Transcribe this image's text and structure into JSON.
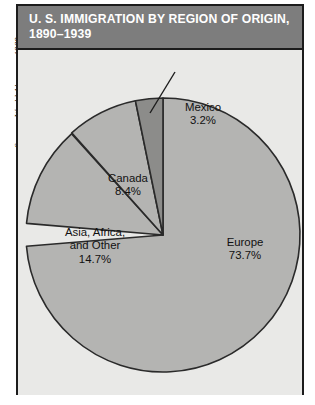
{
  "source": {
    "lead": "Source:",
    "publication": "World Almanac, 1989",
    "full": "Source: World Almanac, 1989"
  },
  "title": {
    "line1": "U. S. IMMIGRATION BY REGION OF ORIGIN,",
    "line2": "1890–1939"
  },
  "labels": {
    "mexico": {
      "name": "Mexico",
      "value": "3.2%"
    },
    "canada": {
      "name": "Canada",
      "value": "8.4%"
    },
    "asia": {
      "name_line1": "Asia, Africa,",
      "name_line2": "and Other",
      "value": "14.7%"
    },
    "europe": {
      "name": "Europe",
      "value": "73.7%"
    }
  },
  "colors": {
    "title_bar": "#7d7d7d",
    "title_text": "#ffffff",
    "panel_background": "#e9e9e7",
    "frame_border": "#1c1c1c",
    "slice_light": "#b4b4b2",
    "slice_dark": "#8c8c8a",
    "slice_outline": "#2a2a2a",
    "label_text": "#111111"
  },
  "chart_data": {
    "type": "pie",
    "subtitle": "",
    "xlabel": "",
    "ylabel": "",
    "units": "percent",
    "start_angle_deg": 0,
    "direction": "clockwise",
    "legend": "none",
    "grid": false,
    "categories": [
      "Europe",
      "Asia, Africa, and Other",
      "Canada",
      "Mexico"
    ],
    "values": [
      73.7,
      14.7,
      8.4,
      3.2
    ],
    "total": 100.0,
    "slices": [
      {
        "label": "Europe",
        "value": 73.7,
        "display": "73.7%",
        "color": "#b4b4b2",
        "start_deg": 0.0,
        "end_deg": 265.3,
        "sweep_deg": 265.3,
        "label_placement": "inside"
      },
      {
        "label": "Asia, Africa, and Other",
        "value": 14.7,
        "display": "14.7%",
        "color": "#b4b4b2",
        "start_deg": 265.3,
        "end_deg": 318.2,
        "sweep_deg": 52.9,
        "label_placement": "inside"
      },
      {
        "label": "Canada",
        "value": 8.4,
        "display": "8.4%",
        "color": "#b4b4b2",
        "start_deg": 318.2,
        "end_deg": 348.4,
        "sweep_deg": 30.2,
        "label_placement": "inside"
      },
      {
        "label": "Mexico",
        "value": 3.2,
        "display": "3.2%",
        "color": "#8c8c8a",
        "start_deg": 348.4,
        "end_deg": 360.0,
        "sweep_deg": 11.6,
        "label_placement": "outside-leader"
      }
    ]
  },
  "geometry": {
    "center_x": 145,
    "center_y": 185,
    "radius": 137
  }
}
